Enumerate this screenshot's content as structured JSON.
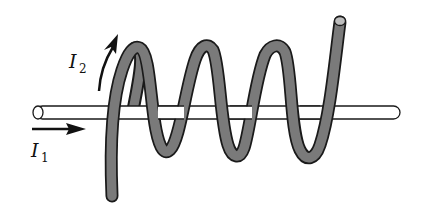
{
  "diagram": {
    "type": "solenoid around straight wire",
    "labels": {
      "current1": {
        "symbol": "I",
        "subscript": "1"
      },
      "current2": {
        "symbol": "I",
        "subscript": "2"
      }
    },
    "colors": {
      "coil_fill": "#7a7a7a",
      "coil_outline": "#1a1a1a",
      "rod_fill": "#ffffff",
      "rod_outline": "#1a1a1a",
      "coil_end_cap": "#bdbdbd",
      "arrow": "#111111"
    },
    "components": {
      "straight_wire": "horizontal rod carrying current I1",
      "coil": "helical tube wound around rod carrying current I2",
      "arrow_I1": "horizontal arrow pointing right below rod",
      "arrow_I2": "curved arrow pointing up along coil start"
    }
  }
}
